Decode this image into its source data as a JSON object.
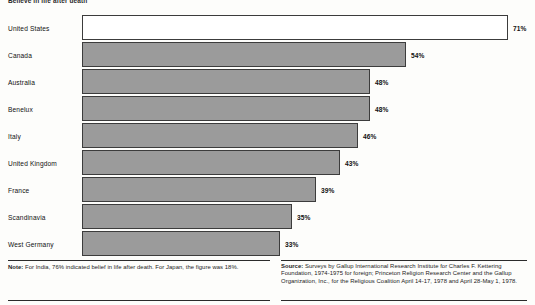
{
  "chart_data": {
    "type": "bar",
    "orientation": "horizontal",
    "title": "Believe in life after death",
    "xlabel": "",
    "ylabel": "",
    "xlim": [
      0,
      71
    ],
    "grid": false,
    "legend": null,
    "value_suffix": "%",
    "categories": [
      "United States",
      "Canada",
      "Australia",
      "Benelux",
      "Italy",
      "United Kingdom",
      "France",
      "Scandinavia",
      "West Germany"
    ],
    "values": [
      71,
      54,
      48,
      48,
      46,
      43,
      39,
      35,
      33
    ],
    "value_labels": [
      "71%",
      "54%",
      "48%",
      "48%",
      "46%",
      "43%",
      "39%",
      "35%",
      "33%"
    ],
    "bar_styles": [
      "hollow",
      "filled",
      "filled",
      "filled",
      "filled",
      "filled",
      "filled",
      "filled",
      "filled"
    ],
    "colors": {
      "bar_fill": "#9b9b9b",
      "bar_hollow_fill": "#ffffff",
      "bar_border": "#3c3c3c",
      "text": "#111111",
      "background": "#fdfdfb"
    }
  },
  "notes": {
    "note_label": "Note:",
    "note_text": " For India, 76% indicated belief in life after death. For Japan, the figure was 18%.",
    "source_label": "Source:",
    "source_text": " Surveys by Gallup International Research Institute for Charles F. Kettering Foundation, 1974-1975 for foreign; Princeton Religion Research Center and the Gallup Organization, Inc., for the Religious Coalition April 14-17, 1978 and April 28-May 1, 1978."
  }
}
